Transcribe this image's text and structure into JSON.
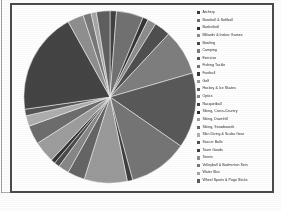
{
  "chart_data": {
    "type": "pie",
    "title": "",
    "legend_position": "right",
    "categories": [
      "Archery",
      "Baseball & Softball",
      "Basketball",
      "Billiards & Indoor Games",
      "Bowling",
      "Camping",
      "Exercise",
      "Fishing Tackle",
      "Football",
      "Golf",
      "Hockey & Ice Skates",
      "Optics",
      "Racquetball",
      "Skiing, Cross-Country",
      "Skiing, Downhill",
      "Skiing, Snowboards",
      "Skin Diving & Scuba Gear",
      "Soccer Balls",
      "Team Goods",
      "Tennis",
      "Volleyball & Badminton Sets",
      "Water Skis",
      "Wheel Sports & Pogo Sticks"
    ],
    "values": [
      1.2,
      5.0,
      1.0,
      1.6,
      3.0,
      8.5,
      14.0,
      11.0,
      1.0,
      8.0,
      3.2,
      2.0,
      1.0,
      0.8,
      4.0,
      3.5,
      2.0,
      1.2,
      19.0,
      3.0,
      1.5,
      1.0,
      2.5
    ],
    "colors": [
      "#3c3c3c",
      "#6f6f6f",
      "#2f2f2f",
      "#8b8b8b",
      "#4a4a4a",
      "#7d7d7d",
      "#555555",
      "#737373",
      "#3a3a3a",
      "#9a9a9a",
      "#626262",
      "#868686",
      "#454545",
      "#2e2e2e",
      "#9e9e9e",
      "#6a6a6a",
      "#b0b0b0",
      "#505050",
      "#3f3f3f",
      "#8f8f8f",
      "#767676",
      "#a6a6a6",
      "#5c5c5c"
    ],
    "units": "percent",
    "grid": false,
    "start_angle_deg": 0,
    "direction": "clockwise"
  },
  "frame": {
    "border_color": "#4a4a4a",
    "background": "#fefefe"
  }
}
